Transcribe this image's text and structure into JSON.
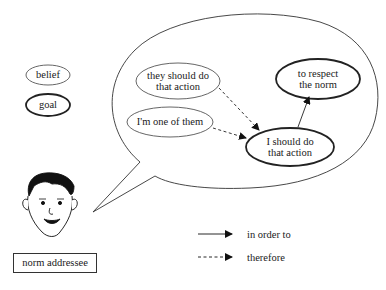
{
  "legend_nodes": {
    "belief": "belief",
    "goal": "goal"
  },
  "thought_bubble": {
    "nodes": [
      {
        "id": "they_should",
        "type": "belief",
        "line1": "they should do",
        "line2": "that action"
      },
      {
        "id": "one_of_them",
        "type": "belief",
        "line1": "I'm one of them"
      },
      {
        "id": "i_should",
        "type": "goal",
        "line1": "I should do",
        "line2": "that action"
      },
      {
        "id": "respect_norm",
        "type": "goal",
        "line1": "to respect",
        "line2": "the norm"
      }
    ],
    "edges": [
      {
        "from": "they_should",
        "to": "i_should",
        "style": "dashed",
        "meaning": "therefore"
      },
      {
        "from": "one_of_them",
        "to": "i_should",
        "style": "dashed",
        "meaning": "therefore"
      },
      {
        "from": "i_should",
        "to": "respect_norm",
        "style": "solid",
        "meaning": "in order to"
      }
    ]
  },
  "agent": {
    "icon": "face-icon",
    "label": "norm addressee"
  },
  "arrow_legend": {
    "solid": "in order to",
    "dashed": "therefore"
  }
}
